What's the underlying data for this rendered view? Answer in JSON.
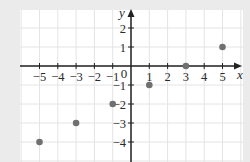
{
  "chart_data": {
    "type": "scatter",
    "title": "",
    "xlabel": "x",
    "ylabel": "y",
    "xlim": [
      -6,
      6
    ],
    "ylim": [
      -5,
      3
    ],
    "grid": true,
    "legend": null,
    "x_ticks": [
      -5,
      -4,
      -3,
      -2,
      -1,
      1,
      2,
      3,
      4,
      5
    ],
    "x_tick_labels": [
      "−5",
      "−4",
      "−3",
      "−2",
      "−1",
      "1",
      "2",
      "3",
      "4",
      "5"
    ],
    "y_ticks": [
      2,
      1,
      -1,
      -2,
      -3,
      -4
    ],
    "y_tick_labels": [
      "2",
      "1",
      "−1",
      "−2",
      "−3",
      "−4"
    ],
    "origin_label": "0",
    "series": [
      {
        "name": "points",
        "color": "#707070",
        "points": [
          {
            "x": -5,
            "y": -4
          },
          {
            "x": -3,
            "y": -3
          },
          {
            "x": -1,
            "y": -2
          },
          {
            "x": 1,
            "y": -1
          },
          {
            "x": 3,
            "y": 0
          },
          {
            "x": 5,
            "y": 1
          }
        ]
      }
    ]
  },
  "colors": {
    "page_background": "#ebebeb",
    "plot_background": "#ffffff",
    "grid": "#e4e4e4",
    "axis": "#222222",
    "point": "#707070"
  }
}
